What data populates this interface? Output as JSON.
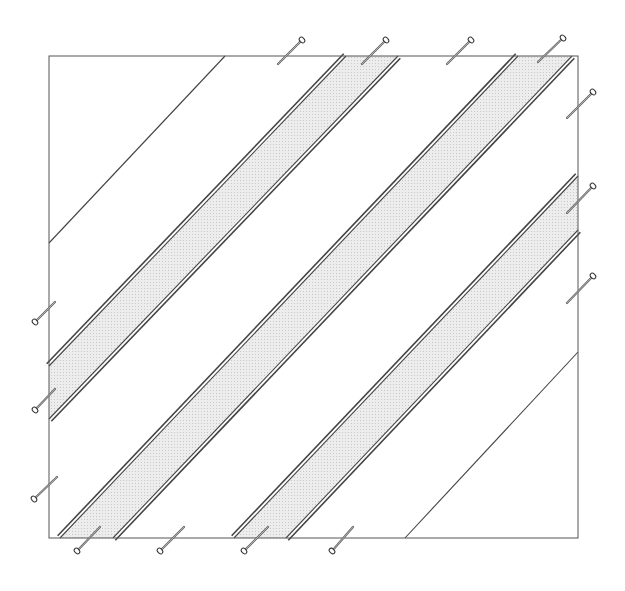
{
  "diagram": {
    "colors": {
      "background": "#ffffff",
      "outline": "#555555",
      "seam": "#444444",
      "strip_fill": "#e4e4e4",
      "pin": "#6a6a6a"
    },
    "frame": {
      "x1": 49,
      "y1": 56,
      "x2": 578,
      "y2": 538
    },
    "single_lines": [
      {
        "name": "diagonal-line-top-left",
        "from": [
          225,
          56
        ],
        "to": [
          49,
          243
        ]
      },
      {
        "name": "diagonal-line-bottom-right",
        "from": [
          578,
          352
        ],
        "to": [
          405,
          538
        ]
      }
    ],
    "strips": [
      {
        "name": "strip-upper-left",
        "polygon": [
          [
            346,
            56
          ],
          [
            398,
            56
          ],
          [
            49,
            419
          ],
          [
            49,
            366
          ]
        ],
        "edge_a": {
          "from": [
            346,
            56
          ],
          "to": [
            49,
            366
          ]
        },
        "edge_b": {
          "from": [
            398,
            56
          ],
          "to": [
            49,
            419
          ]
        }
      },
      {
        "name": "strip-center",
        "polygon": [
          [
            518,
            56
          ],
          [
            572,
            56
          ],
          [
            113,
            538
          ],
          [
            60,
            538
          ]
        ],
        "edge_a": {
          "from": [
            518,
            56
          ],
          "to": [
            60,
            538
          ]
        },
        "edge_b": {
          "from": [
            572,
            56
          ],
          "to": [
            113,
            538
          ]
        }
      },
      {
        "name": "strip-lower-right",
        "polygon": [
          [
            578,
            176
          ],
          [
            578,
            230
          ],
          [
            286,
            538
          ],
          [
            234,
            538
          ]
        ],
        "edge_a": {
          "from": [
            578,
            176
          ],
          "to": [
            234,
            538
          ]
        },
        "edge_b": {
          "from": [
            578,
            230
          ],
          "to": [
            286,
            538
          ]
        }
      }
    ],
    "pins": [
      {
        "side": "top",
        "tip": [
          278,
          64
        ],
        "head": [
          302,
          40
        ]
      },
      {
        "side": "top",
        "tip": [
          362,
          64
        ],
        "head": [
          386,
          40
        ]
      },
      {
        "side": "top",
        "tip": [
          447,
          64
        ],
        "head": [
          471,
          40
        ]
      },
      {
        "side": "top",
        "tip": [
          538,
          62
        ],
        "head": [
          563,
          38
        ]
      },
      {
        "side": "right",
        "tip": [
          567,
          118
        ],
        "head": [
          593,
          92
        ]
      },
      {
        "side": "right",
        "tip": [
          567,
          213
        ],
        "head": [
          593,
          186
        ]
      },
      {
        "side": "right",
        "tip": [
          567,
          303
        ],
        "head": [
          593,
          276
        ]
      },
      {
        "side": "left",
        "tip": [
          55,
          302
        ],
        "head": [
          35,
          322
        ]
      },
      {
        "side": "left",
        "tip": [
          55,
          389
        ],
        "head": [
          35,
          410
        ]
      },
      {
        "side": "left",
        "tip": [
          57,
          477
        ],
        "head": [
          34,
          499
        ]
      },
      {
        "side": "bottom",
        "tip": [
          100,
          527
        ],
        "head": [
          77,
          551
        ]
      },
      {
        "side": "bottom",
        "tip": [
          184,
          527
        ],
        "head": [
          160,
          551
        ]
      },
      {
        "side": "bottom",
        "tip": [
          268,
          527
        ],
        "head": [
          244,
          551
        ]
      },
      {
        "side": "bottom",
        "tip": [
          353,
          527
        ],
        "head": [
          332,
          551
        ]
      }
    ]
  }
}
